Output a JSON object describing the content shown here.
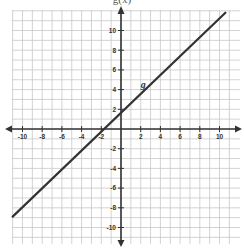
{
  "chart_data": {
    "type": "line",
    "title": "g(x)",
    "xlabel": "",
    "ylabel": "",
    "xlim": [
      -11,
      11
    ],
    "ylim": [
      -11,
      12
    ],
    "grid": true,
    "grid_step": 1,
    "x_ticks": [
      -10,
      -8,
      -6,
      -4,
      -2,
      2,
      4,
      6,
      8,
      10
    ],
    "y_ticks": [
      10,
      8,
      6,
      4,
      2,
      -2,
      -4,
      -6,
      -8,
      -10
    ],
    "series": [
      {
        "name": "g",
        "label": "g",
        "label_position": {
          "x": 2,
          "y": 4.5
        },
        "points": [
          {
            "x": -11,
            "y": -8.9
          },
          {
            "x": 10.6,
            "y": 11.8
          }
        ],
        "slope": 0.96,
        "x_intercept": -1.9,
        "y_intercept": 1.8,
        "color": "#333333"
      }
    ],
    "legend": "none"
  }
}
